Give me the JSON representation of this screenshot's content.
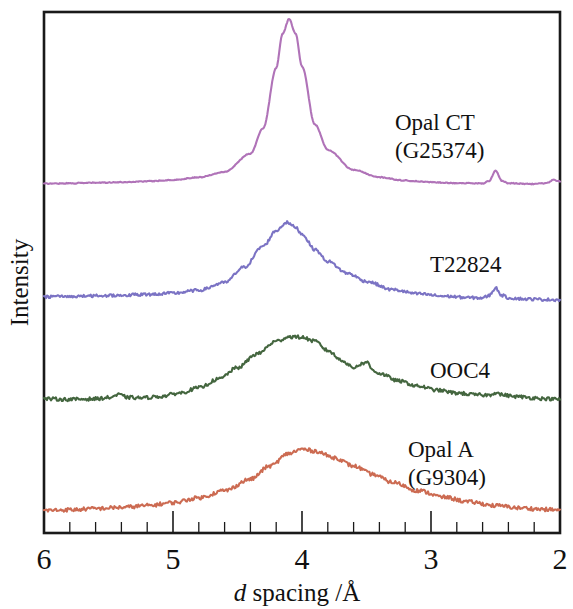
{
  "figure": {
    "title": "",
    "frame": {
      "left": 44,
      "right": 560,
      "top": 12,
      "bottom": 533
    }
  },
  "chart_data": {
    "type": "line",
    "title": "",
    "subtitle": "",
    "xlabel": "d spacing /Å",
    "xlabel_italic_part": "d",
    "xlabel_rest": " spacing /Å",
    "ylabel": "Intensity",
    "xlim": [
      6,
      2
    ],
    "x_axis_direction": "decreasing",
    "ylim": [
      0,
      1
    ],
    "y_ticks": [],
    "y_ticklabels": [],
    "grid": false,
    "legend_position": "inline-right-of-curve",
    "x_ticks": [
      6,
      5,
      4,
      3,
      2
    ],
    "x_ticklabels": [
      "6",
      "5",
      "4",
      "3",
      "2"
    ],
    "x_minor_tick_interval": 0.2,
    "series": [
      {
        "name": "Opal CT (G25374)",
        "label_line1": "Opal CT",
        "label_line2": "(G25374)",
        "color": "#b073b8",
        "noise": 0.0025,
        "baseline": 0.02,
        "peaks": [
          {
            "center": 4.1,
            "height": 0.92,
            "width": 0.16
          },
          {
            "center": 4.1,
            "height": 0.3,
            "width": 0.45
          },
          {
            "center": 2.5,
            "height": 0.085,
            "width": 0.055
          },
          {
            "center": 2.04,
            "height": 0.045,
            "width": 0.05
          }
        ],
        "x": [
          6.0,
          5.8,
          5.6,
          5.4,
          5.2,
          5.0,
          4.8,
          4.6,
          4.4,
          4.3,
          4.2,
          4.15,
          4.1,
          4.05,
          4.0,
          3.9,
          3.8,
          3.6,
          3.4,
          3.2,
          3.0,
          2.8,
          2.6,
          2.55,
          2.5,
          2.45,
          2.4,
          2.2,
          2.1,
          2.05,
          2.0
        ],
        "y": [
          0.035,
          0.037,
          0.04,
          0.043,
          0.048,
          0.055,
          0.07,
          0.1,
          0.2,
          0.34,
          0.67,
          0.86,
          0.94,
          0.86,
          0.68,
          0.36,
          0.22,
          0.11,
          0.07,
          0.052,
          0.043,
          0.038,
          0.036,
          0.05,
          0.105,
          0.05,
          0.037,
          0.033,
          0.038,
          0.055,
          0.048
        ]
      },
      {
        "name": "T22824",
        "label_line1": "T22824",
        "label_line2": "",
        "color": "#7b73c4",
        "noise": 0.012,
        "baseline": 0.03,
        "peaks": [
          {
            "center": 4.08,
            "height": 0.66,
            "width": 0.3
          },
          {
            "center": 2.5,
            "height": 0.09,
            "width": 0.05
          }
        ],
        "x": [
          6.0,
          5.8,
          5.6,
          5.4,
          5.2,
          5.0,
          4.8,
          4.6,
          4.45,
          4.3,
          4.2,
          4.12,
          4.05,
          4.0,
          3.9,
          3.8,
          3.65,
          3.5,
          3.3,
          3.1,
          2.9,
          2.7,
          2.6,
          2.55,
          2.5,
          2.45,
          2.4,
          2.25,
          2.1,
          2.0
        ],
        "y": [
          0.07,
          0.073,
          0.078,
          0.083,
          0.09,
          0.1,
          0.125,
          0.19,
          0.32,
          0.5,
          0.63,
          0.7,
          0.66,
          0.6,
          0.47,
          0.37,
          0.27,
          0.2,
          0.13,
          0.095,
          0.075,
          0.062,
          0.06,
          0.08,
          0.145,
          0.082,
          0.06,
          0.05,
          0.046,
          0.044
        ]
      },
      {
        "name": "OOC4",
        "label_line1": "OOC4",
        "label_line2": "",
        "color": "#44663f",
        "noise": 0.015,
        "baseline": 0.035,
        "peaks": [
          {
            "center": 4.05,
            "height": 0.58,
            "width": 0.38
          },
          {
            "center": 5.42,
            "height": 0.05,
            "width": 0.09
          },
          {
            "center": 3.52,
            "height": 0.085,
            "width": 0.035
          }
        ],
        "x": [
          6.0,
          5.8,
          5.6,
          5.5,
          5.42,
          5.35,
          5.25,
          5.1,
          4.95,
          4.8,
          4.65,
          4.5,
          4.35,
          4.2,
          4.1,
          4.0,
          3.9,
          3.8,
          3.7,
          3.6,
          3.55,
          3.5,
          3.45,
          3.4,
          3.25,
          3.1,
          2.95,
          2.8,
          2.65,
          2.55,
          2.5,
          2.45,
          2.35,
          2.2,
          2.1,
          2.0
        ],
        "y": [
          0.08,
          0.075,
          0.08,
          0.09,
          0.115,
          0.092,
          0.088,
          0.1,
          0.13,
          0.175,
          0.25,
          0.35,
          0.47,
          0.58,
          0.62,
          0.615,
          0.58,
          0.5,
          0.42,
          0.35,
          0.38,
          0.4,
          0.33,
          0.3,
          0.235,
          0.19,
          0.155,
          0.13,
          0.115,
          0.112,
          0.135,
          0.115,
          0.1,
          0.088,
          0.08,
          0.075
        ]
      },
      {
        "name": "Opal A (G9304)",
        "label_line1": "Opal A",
        "label_line2": "(G9304)",
        "color": "#cc6b52",
        "noise": 0.016,
        "baseline": 0.04,
        "peaks": [
          {
            "center": 4.02,
            "height": 0.55,
            "width": 0.52
          }
        ],
        "x": [
          6.0,
          5.8,
          5.6,
          5.4,
          5.2,
          5.0,
          4.8,
          4.6,
          4.4,
          4.25,
          4.1,
          4.0,
          3.9,
          3.75,
          3.6,
          3.45,
          3.3,
          3.1,
          2.9,
          2.7,
          2.5,
          2.3,
          2.15,
          2.05,
          2.0
        ],
        "y": [
          0.08,
          0.085,
          0.095,
          0.105,
          0.12,
          0.145,
          0.185,
          0.245,
          0.34,
          0.45,
          0.555,
          0.59,
          0.575,
          0.52,
          0.45,
          0.38,
          0.315,
          0.245,
          0.19,
          0.15,
          0.12,
          0.1,
          0.09,
          0.085,
          0.082
        ]
      }
    ],
    "annotations": [
      {
        "text": "Opal CT",
        "x_px": 395,
        "y_px": 130
      },
      {
        "text": "(G25374)",
        "x_px": 395,
        "y_px": 158
      },
      {
        "text": "T22824",
        "x_px": 430,
        "y_px": 272
      },
      {
        "text": "OOC4",
        "x_px": 430,
        "y_px": 378
      },
      {
        "text": "Opal A",
        "x_px": 408,
        "y_px": 457
      },
      {
        "text": "(G9304)",
        "x_px": 408,
        "y_px": 485
      }
    ]
  }
}
